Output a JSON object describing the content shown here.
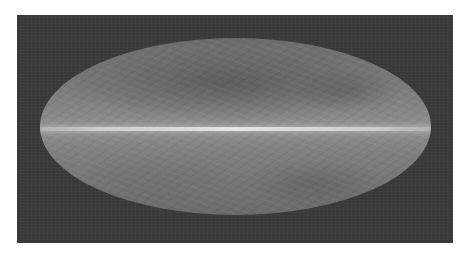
{
  "image": {
    "description": "Grayscale all-sky map in Mollweide (elliptical) projection with a bright horizontal galactic plane band across the center",
    "projection": "mollweide",
    "colors": {
      "background_frame": "#3a3a3a",
      "ellipse_fill": "#808080",
      "galactic_plane": "#e0e0e0",
      "page_background": "#ffffff"
    }
  }
}
